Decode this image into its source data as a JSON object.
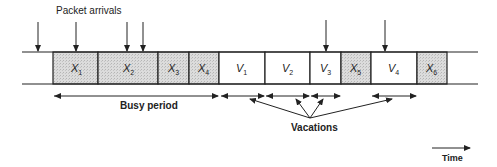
{
  "title": "Packet arrivals",
  "labels": {
    "busy_period": "Busy period",
    "vacations": "Vacations",
    "time": "Time"
  },
  "colors": {
    "line": "#222222",
    "service_fill": "#d9d9d9",
    "vacation_fill": "#ffffff"
  },
  "timeline": {
    "segments": [
      {
        "type": "service",
        "main": "X",
        "sub": "1",
        "x0": 53,
        "x1": 98
      },
      {
        "type": "service",
        "main": "X",
        "sub": "2",
        "x0": 98,
        "x1": 158
      },
      {
        "type": "service",
        "main": "X",
        "sub": "3",
        "x0": 158,
        "x1": 189
      },
      {
        "type": "service",
        "main": "X",
        "sub": "4",
        "x0": 189,
        "x1": 219
      },
      {
        "type": "vacation",
        "main": "V",
        "sub": "1",
        "x0": 219,
        "x1": 265
      },
      {
        "type": "vacation",
        "main": "V",
        "sub": "2",
        "x0": 265,
        "x1": 310
      },
      {
        "type": "vacation",
        "main": "V",
        "sub": "3",
        "x0": 310,
        "x1": 341
      },
      {
        "type": "service",
        "main": "X",
        "sub": "5",
        "x0": 341,
        "x1": 371
      },
      {
        "type": "vacation",
        "main": "V",
        "sub": "4",
        "x0": 371,
        "x1": 417
      },
      {
        "type": "service",
        "main": "X",
        "sub": "6",
        "x0": 417,
        "x1": 447
      }
    ],
    "arrival_x": [
      38,
      76,
      127,
      143,
      326,
      385
    ]
  }
}
